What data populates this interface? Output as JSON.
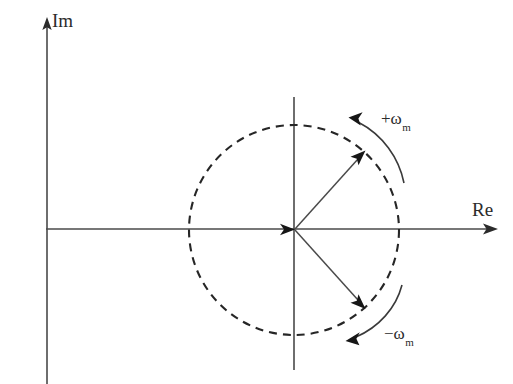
{
  "figure": {
    "background_color": "#ffffff",
    "width": 513,
    "height": 384
  },
  "axes": {
    "imaginary": {
      "label": "Im",
      "icon": "up-arrow-icon",
      "x": 47,
      "from_y": 384,
      "to_y": 20,
      "color": "#4a4a4a"
    },
    "real": {
      "label": "Re",
      "icon": "right-arrow-icon",
      "y": 228,
      "from_x": 46,
      "to_x": 497,
      "color": "#4a4a4a"
    }
  },
  "unit_circle": {
    "name": "unit-circle",
    "center_x": 294,
    "center_y": 230,
    "radius": 105,
    "style": "dashed",
    "dash_on": 8,
    "dash_off": 6,
    "color": "#262626"
  },
  "origin": {
    "x": 294,
    "y": 230,
    "marker": "arrowhead-at-origin"
  },
  "secondary_axes": {
    "vertical_through_origin": {
      "x": 294,
      "from_y": 97,
      "to_y": 370
    },
    "horizontal_through_origin": {
      "y": 230,
      "from_x": 46,
      "to_x": 497
    }
  },
  "phasors": [
    {
      "name": "positive-frequency-phasor",
      "label": "",
      "angle_deg": 48,
      "tip_x": 364,
      "tip_y": 152,
      "color": "#4a4a4a"
    },
    {
      "name": "negative-frequency-phasor",
      "label": "",
      "angle_deg": -48,
      "tip_x": 364,
      "tip_y": 308,
      "color": "#4a4a4a"
    }
  ],
  "rotation_annotations": [
    {
      "name": "positive-rotation",
      "sign": "+",
      "symbol": "ω",
      "subscript": "m",
      "direction": "counterclockwise",
      "label_x": 381,
      "label_y": 110
    },
    {
      "name": "negative-rotation",
      "sign": "−",
      "symbol": "ω",
      "subscript": "m",
      "direction": "clockwise",
      "label_x": 384,
      "label_y": 325
    }
  ]
}
